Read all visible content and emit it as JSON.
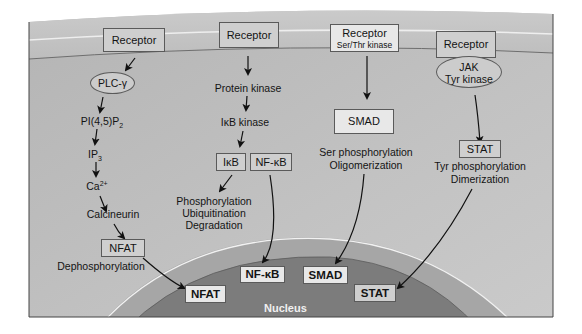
{
  "figure": {
    "compartments": {
      "nucleus_label": "Nucleus"
    },
    "colors": {
      "background": "#ffffff",
      "cytoplasm": "#b9b9b9",
      "membrane": "#c8c8c8",
      "nuclear_envelope": "#a4a4a4",
      "nucleus": "#7d7d7d",
      "box_fill": "#cfcfcf",
      "box_light_fill": "#e8e8e8",
      "text": "#141414"
    },
    "pathways": [
      {
        "name": "NFAT pathway",
        "receptor": "Receptor",
        "steps": [
          "PLC-γ",
          "PI(4,5)P",
          "2",
          "IP",
          "3",
          "Ca",
          "2+",
          "Calcineurin",
          "NFAT",
          "Dephosphorylation"
        ],
        "nuclear_factor": "NFAT"
      },
      {
        "name": "NF-κB pathway",
        "receptor": "Receptor",
        "steps": [
          "Protein kinase",
          "IκB kinase",
          "IκB",
          "NF-κB",
          "Phosphorylation",
          "Ubiquitination",
          "Degradation"
        ],
        "nuclear_factor": "NF-κB"
      },
      {
        "name": "SMAD pathway",
        "receptor": "Receptor",
        "receptor_sub": "Ser/Thr kinase",
        "steps": [
          "SMAD",
          "Ser phosphorylation",
          "Oligomerization"
        ],
        "nuclear_factor": "SMAD"
      },
      {
        "name": "STAT pathway",
        "receptor": "Receptor",
        "kinase_line1": "JAK",
        "kinase_line2": "Tyr kinase",
        "steps": [
          "STAT",
          "Tyr phosphorylation",
          "Dimerization"
        ],
        "nuclear_factor": "STAT"
      }
    ]
  }
}
